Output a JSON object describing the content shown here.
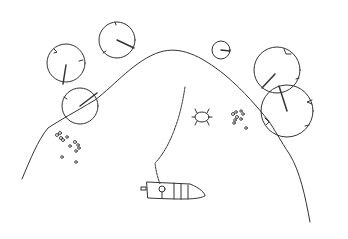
{
  "scene": {
    "description": "Line-art sketch of a pond hill with lily pads, a frog, a fishing line and a small boat",
    "stroke_color": "#333333",
    "background": "#ffffff",
    "lily_pads": [
      {
        "cx": 66,
        "cy": 63,
        "r": 19
      },
      {
        "cx": 117,
        "cy": 40,
        "r": 18
      },
      {
        "cx": 80,
        "cy": 106,
        "r": 18
      },
      {
        "cx": 221,
        "cy": 50,
        "r": 9
      },
      {
        "cx": 277,
        "cy": 70,
        "r": 23
      },
      {
        "cx": 287,
        "cy": 111,
        "r": 26
      }
    ],
    "frog": {
      "x": 202,
      "y": 117
    },
    "boat": {
      "x": 146,
      "y": 181
    },
    "pebbles_left": {
      "x": 55,
      "y": 133
    },
    "pebbles_right": {
      "x": 232,
      "y": 112
    }
  }
}
